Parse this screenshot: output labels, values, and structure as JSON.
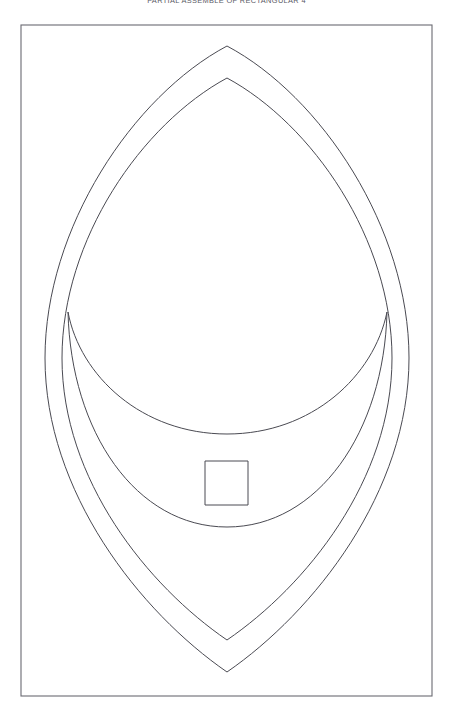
{
  "page": {
    "width": 453,
    "height": 720,
    "background_color": "#ffffff",
    "caption": "PARTIAL ASSEMBLE OF RECTANGULAR 4"
  },
  "frame": {
    "name": "drawing-border",
    "x": 21,
    "y": 25,
    "width": 411,
    "height": 671,
    "stroke_color": "#6a6a72",
    "stroke_width": 1.1,
    "fill": "none"
  },
  "style": {
    "line_color": "#4a4a52",
    "line_width": 1,
    "fill": "none"
  },
  "shapes": [
    {
      "id": "outer-pointed-oval",
      "name": "outer-pointed-oval",
      "type": "pointed-oval",
      "top_apex": {
        "x": 227,
        "y": 46
      },
      "bottom_apex": {
        "x": 227,
        "y": 672
      },
      "left_extreme": {
        "x": 45,
        "y": 358
      },
      "right_extreme": {
        "x": 409,
        "y": 358
      },
      "path": "M 227 46 C 133 96 45 228 45 358 C 45 492 140 612 227 672 C 314 612 409 492 409 358 C 409 228 321 96 227 46 Z"
    },
    {
      "id": "inner-pointed-oval",
      "name": "inner-pointed-oval",
      "type": "pointed-oval",
      "top_apex": {
        "x": 227,
        "y": 78
      },
      "bottom_apex": {
        "x": 227,
        "y": 640
      },
      "left_extreme": {
        "x": 62,
        "y": 358
      },
      "right_extreme": {
        "x": 392,
        "y": 358
      },
      "path": "M 227 78 C 142 124 62 239 62 358 C 62 480 148 586 227 640 C 306 586 392 480 392 358 C 392 239 312 124 227 78 Z"
    },
    {
      "id": "crescent",
      "name": "crescent-moon-shape",
      "type": "crescent",
      "left_horn": {
        "x": 68,
        "y": 312
      },
      "right_horn": {
        "x": 387,
        "y": 312
      },
      "inner_arc_bottom": {
        "x": 227,
        "y": 434
      },
      "outer_arc_bottom": {
        "x": 227,
        "y": 527
      },
      "path": "M 68 312 C 80 376 142 434 227 434 C 312 434 374 376 387 312 C 384 432 318 527 227 527 C 136 527 71 432 68 312 Z"
    },
    {
      "id": "square",
      "name": "small-square",
      "type": "rect",
      "x": 205,
      "y": 461,
      "width": 43,
      "height": 44
    }
  ]
}
